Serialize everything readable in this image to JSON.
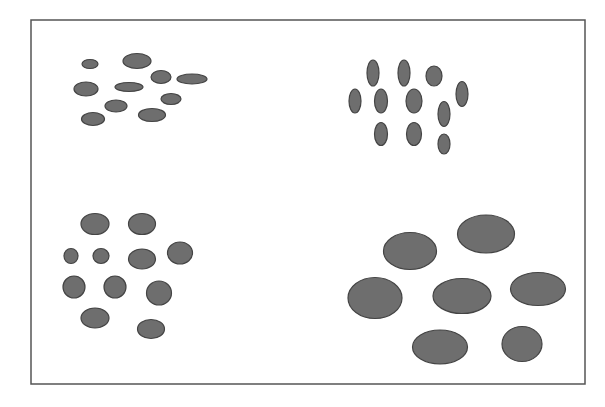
{
  "figure": {
    "frame": {
      "x": 31,
      "y": 20,
      "width": 554,
      "height": 364,
      "stroke": "#555555"
    },
    "fill": "#6e6e6e",
    "stroke": "#444444",
    "groups": [
      {
        "name": "top-left-small-horizontal",
        "ellipses": [
          {
            "cx": 90,
            "cy": 64,
            "rx": 8,
            "ry": 4.5
          },
          {
            "cx": 137,
            "cy": 61,
            "rx": 14,
            "ry": 7.5
          },
          {
            "cx": 161,
            "cy": 77,
            "rx": 10,
            "ry": 6.5
          },
          {
            "cx": 192,
            "cy": 79,
            "rx": 15,
            "ry": 5
          },
          {
            "cx": 86,
            "cy": 89,
            "rx": 12,
            "ry": 7
          },
          {
            "cx": 129,
            "cy": 87,
            "rx": 14,
            "ry": 4.5
          },
          {
            "cx": 171,
            "cy": 99,
            "rx": 10,
            "ry": 5.5
          },
          {
            "cx": 116,
            "cy": 106,
            "rx": 11,
            "ry": 6
          },
          {
            "cx": 152,
            "cy": 115,
            "rx": 13.5,
            "ry": 6.5
          },
          {
            "cx": 93,
            "cy": 119,
            "rx": 11.5,
            "ry": 6.5
          }
        ]
      },
      {
        "name": "top-right-small-vertical",
        "ellipses": [
          {
            "cx": 373,
            "cy": 73,
            "rx": 6,
            "ry": 13
          },
          {
            "cx": 404,
            "cy": 73,
            "rx": 6,
            "ry": 13
          },
          {
            "cx": 434,
            "cy": 76,
            "rx": 8,
            "ry": 10
          },
          {
            "cx": 462,
            "cy": 94,
            "rx": 6,
            "ry": 12.5
          },
          {
            "cx": 355,
            "cy": 101,
            "rx": 6,
            "ry": 12
          },
          {
            "cx": 381,
            "cy": 101,
            "rx": 6.5,
            "ry": 12
          },
          {
            "cx": 414,
            "cy": 101,
            "rx": 8,
            "ry": 12
          },
          {
            "cx": 444,
            "cy": 114,
            "rx": 6,
            "ry": 12.5
          },
          {
            "cx": 381,
            "cy": 134,
            "rx": 6.5,
            "ry": 11.5
          },
          {
            "cx": 414,
            "cy": 134,
            "rx": 7.5,
            "ry": 11.5
          },
          {
            "cx": 444,
            "cy": 144,
            "rx": 6,
            "ry": 10
          }
        ]
      },
      {
        "name": "bottom-left-medium-round",
        "ellipses": [
          {
            "cx": 95,
            "cy": 224,
            "rx": 14,
            "ry": 10.5
          },
          {
            "cx": 142,
            "cy": 224,
            "rx": 13.5,
            "ry": 10.5
          },
          {
            "cx": 71,
            "cy": 256,
            "rx": 7,
            "ry": 7.5
          },
          {
            "cx": 101,
            "cy": 256,
            "rx": 8,
            "ry": 7.5
          },
          {
            "cx": 142,
            "cy": 259,
            "rx": 13.5,
            "ry": 10
          },
          {
            "cx": 180,
            "cy": 253,
            "rx": 12.5,
            "ry": 11
          },
          {
            "cx": 74,
            "cy": 287,
            "rx": 11,
            "ry": 11
          },
          {
            "cx": 115,
            "cy": 287,
            "rx": 11,
            "ry": 11
          },
          {
            "cx": 159,
            "cy": 293,
            "rx": 12.5,
            "ry": 12
          },
          {
            "cx": 95,
            "cy": 318,
            "rx": 14,
            "ry": 10
          },
          {
            "cx": 151,
            "cy": 329,
            "rx": 13.5,
            "ry": 9.5
          }
        ]
      },
      {
        "name": "bottom-right-large",
        "ellipses": [
          {
            "cx": 410,
            "cy": 251,
            "rx": 26.5,
            "ry": 18.5
          },
          {
            "cx": 486,
            "cy": 234,
            "rx": 28.5,
            "ry": 19
          },
          {
            "cx": 375,
            "cy": 298,
            "rx": 27,
            "ry": 20.5
          },
          {
            "cx": 462,
            "cy": 296,
            "rx": 29,
            "ry": 17.5
          },
          {
            "cx": 538,
            "cy": 289,
            "rx": 27.5,
            "ry": 16.5
          },
          {
            "cx": 440,
            "cy": 347,
            "rx": 27.5,
            "ry": 17
          },
          {
            "cx": 522,
            "cy": 344,
            "rx": 20,
            "ry": 17.5
          }
        ]
      }
    ]
  }
}
